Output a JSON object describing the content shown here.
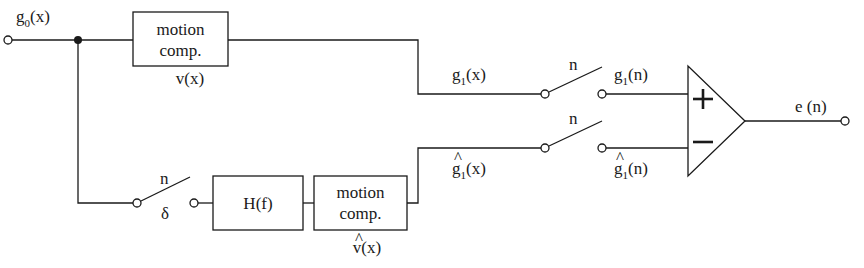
{
  "diagram": {
    "input": {
      "label": "g",
      "subscript": "0",
      "suffix": "(x)"
    },
    "top_block": {
      "line1": "motion",
      "line2": "comp.",
      "caption": "v(x)"
    },
    "bottom_sample_switch": {
      "control": "n",
      "label": "δ"
    },
    "filter_block": {
      "label": "H(f)"
    },
    "bottom_block": {
      "line1": "motion",
      "line2": "comp.",
      "caption": "v(x)",
      "caption_hat": "^"
    },
    "top_signal": {
      "label": "g",
      "subscript": "1",
      "suffix": "(x)"
    },
    "bottom_signal": {
      "label": "g",
      "subscript": "1",
      "suffix": "(x)",
      "hat": "^"
    },
    "top_switch": {
      "control": "n"
    },
    "bottom_switch": {
      "control": "n"
    },
    "top_sampled": {
      "label": "g",
      "subscript": "1",
      "suffix": "(n)"
    },
    "bottom_sampled": {
      "label": "g",
      "subscript": "1",
      "suffix": "(n)",
      "hat": "^"
    },
    "comparator": {
      "plus": "+",
      "minus": "−"
    },
    "output": {
      "label": "e (n)"
    }
  }
}
